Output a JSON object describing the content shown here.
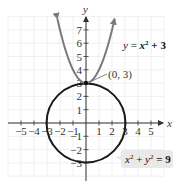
{
  "chart_data": {
    "type": "line",
    "title": "",
    "xlabel": "x",
    "ylabel": "y",
    "xlim": [
      -6,
      6
    ],
    "ylim": [
      -4,
      8
    ],
    "grid": true,
    "x_ticks": [
      -5,
      -4,
      -3,
      -2,
      -1,
      1,
      2,
      3,
      4,
      5
    ],
    "y_ticks": [
      -3,
      -2,
      -1,
      1,
      2,
      3,
      4,
      5,
      6,
      7
    ],
    "x_tick_labels": [
      "−5",
      "−4",
      "−3",
      "−2",
      "−1",
      "1",
      "2",
      "3",
      "4",
      "5"
    ],
    "y_tick_labels": [
      "−3",
      "−2",
      "−1",
      "1",
      "2",
      "3",
      "4",
      "5",
      "6",
      "7"
    ],
    "series": [
      {
        "name": "y = x² + 3",
        "kind": "parabola",
        "equation": "y = x^2 + 3",
        "color": "#7a7a7a",
        "x_range": [
          -2.2,
          2.2
        ],
        "points": [
          [
            -2.2,
            7.84
          ],
          [
            -2,
            7
          ],
          [
            -1.5,
            5.25
          ],
          [
            -1,
            4
          ],
          [
            -0.5,
            3.25
          ],
          [
            0,
            3
          ],
          [
            0.5,
            3.25
          ],
          [
            1,
            4
          ],
          [
            1.5,
            5.25
          ],
          [
            2,
            7
          ],
          [
            2.2,
            7.84
          ]
        ],
        "arrows": "both-ends"
      },
      {
        "name": "x² + y² = 9",
        "kind": "circle",
        "equation": "x^2 + y^2 = 9",
        "color": "#1a1a1a",
        "center": [
          0,
          0
        ],
        "radius": 3
      }
    ],
    "annotations": [
      {
        "text": "(0, 3)",
        "point": [
          0,
          3
        ],
        "type": "intersection-point"
      },
      {
        "text": "y = x² + 3",
        "target": "parabola",
        "type": "equation-label"
      },
      {
        "text": "x² + y² = 9",
        "target": "circle",
        "type": "equation-label-boxed"
      }
    ]
  },
  "labels": {
    "x_axis": "x",
    "y_axis": "y",
    "point": "(0, 3)",
    "parabola_eq": {
      "y": "y",
      "eq": " = ",
      "x": "x",
      "exp": "2",
      "rest": " + 3"
    },
    "circle_eq": {
      "x": "x",
      "exp1": "2",
      "plus": " + ",
      "y": "y",
      "exp2": "2",
      "eq": " = 9"
    }
  }
}
